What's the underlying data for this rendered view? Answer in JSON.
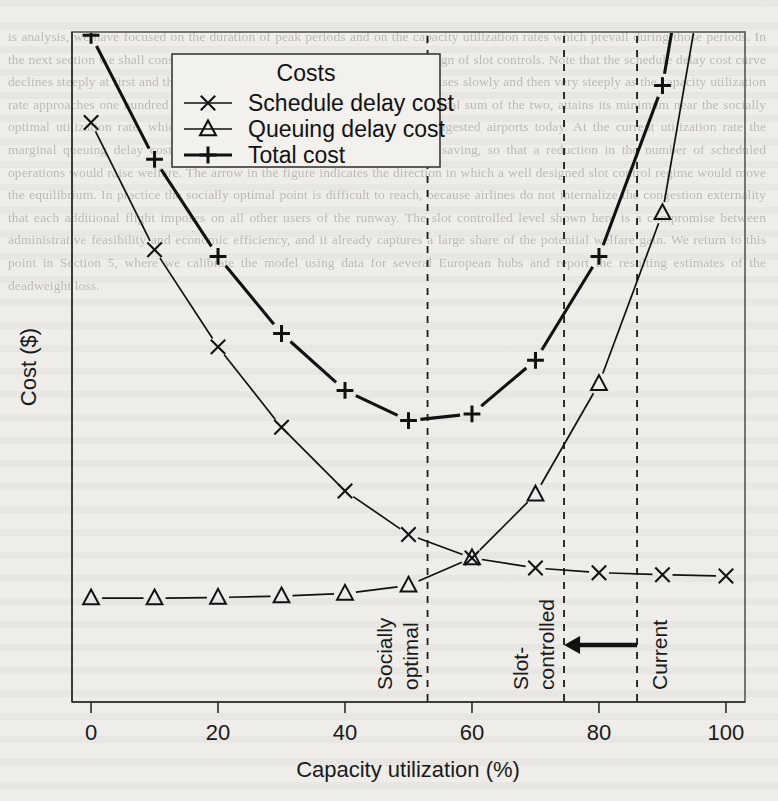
{
  "background_text": "is analysis, we have focused on the duration of peak periods and on the capacity utilization rates which prevail during those periods. In the next section we shall consider the implications of these results for the design of slot controls. Note that the schedule delay cost curve declines steeply at first and then flattens, while the queuing delay cost curve rises slowly and then very steeply as the capacity utilization rate approaches one hundred per cent. The total cost curve, which is the vertical sum of the two, attains its minimum near the socially optimal utilization rate, which is well below the rate observed at most congested airports today. At the current utilization rate the marginal queuing delay cost greatly exceeds the marginal schedule delay saving, so that a reduction in the number of scheduled operations would raise welfare. The arrow in the figure indicates the direction in which a well designed slot control regime would move the equilibrium. In practice the socially optimal point is difficult to reach, because airlines do not internalize the congestion externality that each additional flight imposes on all other users of the runway. The slot controlled level shown here is a compromise between administrative feasibility and economic efficiency, and it already captures a large share of the potential welfare gain. We return to this point in Section 5, where we calibrate the model using data for several European hubs and report the resulting estimates of the deadweight loss.",
  "figure": {
    "axis": {
      "x_title": "Capacity utilization (%)",
      "y_title": "Cost ($)",
      "x_ticks": [
        0,
        20,
        40,
        60,
        80,
        100
      ],
      "x_tick_labels": [
        "0",
        "20",
        "40",
        "60",
        "80",
        "100"
      ],
      "y_ticks": [],
      "y_tick_labels": [],
      "xlim": [
        -3,
        103
      ],
      "ylim": [
        0,
        100
      ],
      "grid": false
    },
    "legend": {
      "title": "Costs",
      "position": "top-left-inside",
      "entries": [
        {
          "label": "Schedule delay cost",
          "marker": "x-marker-icon",
          "weight": "thin"
        },
        {
          "label": "Queuing delay cost",
          "marker": "triangle-marker-icon",
          "weight": "thin"
        },
        {
          "label": "Total cost",
          "marker": "plus-marker-icon",
          "weight": "thick"
        }
      ]
    },
    "annotations": [
      {
        "name": "socially-optimal",
        "x": 53,
        "lines": [
          "Socially",
          "optimal"
        ],
        "side": "left",
        "style": "dashed-vertical"
      },
      {
        "name": "slot-controlled",
        "x": 74.5,
        "lines": [
          "Slot-",
          "controlled"
        ],
        "side": "left",
        "style": "dashed-vertical"
      },
      {
        "name": "current",
        "x": 86,
        "lines": [
          "Current"
        ],
        "side": "right",
        "style": "dashed-vertical"
      }
    ],
    "arrow": {
      "name": "reduction-arrow",
      "from_x": 86,
      "to_x": 74.5,
      "y": 8.5,
      "direction": "left"
    }
  },
  "chart_data": {
    "type": "line",
    "title": "",
    "xlabel": "Capacity utilization (%)",
    "ylabel": "Cost ($)",
    "xlim": [
      -3,
      103
    ],
    "ylim": [
      0,
      100
    ],
    "grid": false,
    "legend_title": "Costs",
    "x": [
      0,
      10,
      20,
      30,
      40,
      50,
      60,
      70,
      80,
      90,
      100
    ],
    "series": [
      {
        "name": "Schedule delay cost",
        "marker": "x",
        "values": [
          86.5,
          67.5,
          53.0,
          41.0,
          31.5,
          25.0,
          21.5,
          20.0,
          19.3,
          19.0,
          18.8
        ]
      },
      {
        "name": "Queuing delay cost",
        "marker": "triangle",
        "values": [
          15.5,
          15.5,
          15.6,
          15.8,
          16.2,
          17.4,
          21.5,
          31.0,
          47.5,
          73.0,
          128.0
        ]
      },
      {
        "name": "Total cost",
        "marker": "plus",
        "values": [
          99.5,
          81.0,
          66.5,
          55.0,
          46.5,
          42.0,
          43.0,
          51.0,
          66.5,
          92.0,
          147.0
        ]
      }
    ],
    "annotations": [
      {
        "text": "Socially optimal",
        "x": 53
      },
      {
        "text": "Slot-controlled",
        "x": 74.5
      },
      {
        "text": "Current",
        "x": 86
      }
    ]
  }
}
